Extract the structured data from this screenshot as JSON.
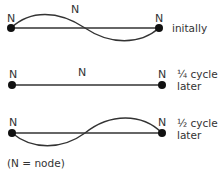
{
  "diagram": {
    "node_label": "N",
    "rows": [
      {
        "caption_line1": "initally",
        "caption_line2": ""
      },
      {
        "caption_line1": "¼ cycle",
        "caption_line2": "later"
      },
      {
        "caption_line1": "½ cycle",
        "caption_line2": "later"
      }
    ],
    "legend": "(N = node)",
    "colors": {
      "line": "#333333",
      "node": "#111111"
    }
  }
}
